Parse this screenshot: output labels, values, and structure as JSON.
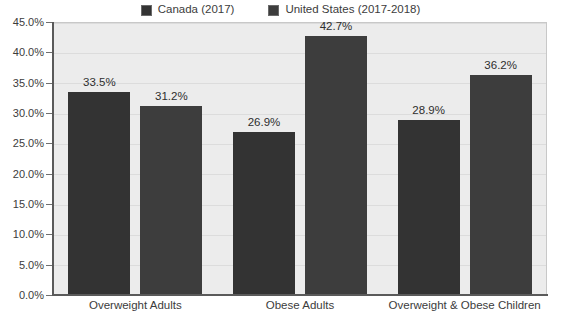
{
  "chart_data": {
    "type": "bar",
    "title": "",
    "subtitle": "",
    "xlabel": "",
    "ylabel": "",
    "categories": [
      "Overweight Adults",
      "Obese Adults",
      "Overweight & Obese Children"
    ],
    "series": [
      {
        "name": "Canada (2017)",
        "color": "#333333",
        "values": [
          33.5,
          26.9,
          28.9
        ],
        "value_labels": [
          "33.5%",
          "26.9%",
          "28.9%"
        ]
      },
      {
        "name": "United States (2017-2018)",
        "color": "#3d3d3d",
        "values": [
          31.2,
          42.7,
          36.2
        ],
        "value_labels": [
          "31.2%",
          "42.7%",
          "36.2%"
        ]
      }
    ],
    "ylim": [
      0,
      45
    ],
    "ytick_values": [
      0,
      5,
      10,
      15,
      20,
      25,
      30,
      35,
      40,
      45
    ],
    "ytick_labels": [
      "0.0%",
      "5.0%",
      "10.0%",
      "15.0%",
      "20.0%",
      "25.0%",
      "30.0%",
      "35.0%",
      "40.0%",
      "45.0%"
    ],
    "grid": true,
    "legend_position": "top-center",
    "plot_background": "#ececec",
    "gridline_color": "#dcdcdc",
    "axis_color": "#5a5a5a"
  },
  "legend": {
    "entries": [
      {
        "label": "Canada (2017)",
        "swatch_name": "legend-swatch-canada"
      },
      {
        "label": "United States (2017-2018)",
        "swatch_name": "legend-swatch-united-states"
      }
    ]
  }
}
